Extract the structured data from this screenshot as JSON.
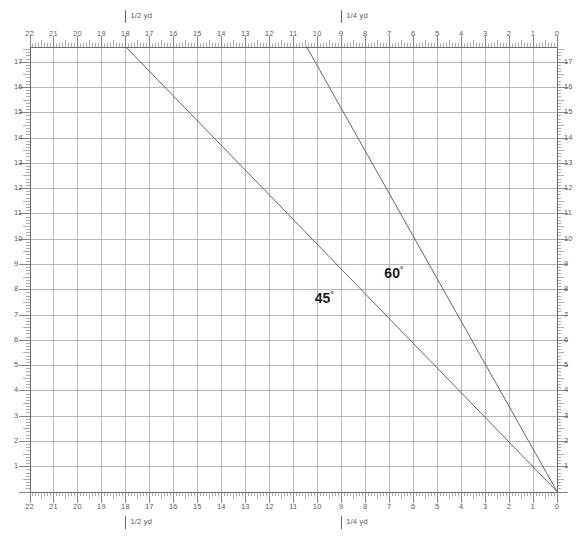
{
  "chart_data": {
    "type": "line",
    "title": "",
    "xlabel": "",
    "ylabel": "",
    "grid": true,
    "legend": "none",
    "xlim": [
      0,
      22
    ],
    "ylim": [
      0,
      17.6
    ],
    "x_axis": {
      "direction": "right-to-left",
      "major_tick_labels": [
        "22",
        "21",
        "20",
        "19",
        "18",
        "17",
        "16",
        "15",
        "14",
        "13",
        "12",
        "11",
        "10",
        "9",
        "8",
        "7",
        "6",
        "5",
        "4",
        "3",
        "2",
        "1",
        "0"
      ],
      "minor_ticks_per_major": 8,
      "unit_markers": [
        {
          "label": "1/2 yd",
          "value": 18
        },
        {
          "label": "1/4 yd",
          "value": 9
        }
      ]
    },
    "y_axis": {
      "direction": "bottom-to-top",
      "major_tick_labels": [
        "1",
        "2",
        "3",
        "4",
        "5",
        "6",
        "7",
        "8",
        "9",
        "10",
        "11",
        "12",
        "13",
        "14",
        "15",
        "16",
        "17"
      ],
      "minor_ticks_per_major": 8
    },
    "series": [
      {
        "name": "45",
        "label": "45°",
        "degree_symbol": "°",
        "color": "#55555a",
        "points": [
          [
            18,
            17.6
          ],
          [
            0,
            0
          ]
        ],
        "label_position": [
          10.1,
          7.6
        ]
      },
      {
        "name": "60",
        "label": "60°",
        "degree_symbol": "°",
        "color": "#55555a",
        "points": [
          [
            10.45,
            17.6
          ],
          [
            0,
            0
          ]
        ],
        "label_position": [
          7.2,
          8.6
        ]
      }
    ]
  },
  "rulers": {
    "top": {
      "name": "top-ruler",
      "labels": [
        "22",
        "21",
        "20",
        "19",
        "18",
        "17",
        "16",
        "15",
        "14",
        "13",
        "12",
        "11",
        "10",
        "9",
        "8",
        "7",
        "6",
        "5",
        "4",
        "3",
        "2",
        "1",
        "0"
      ],
      "markers": [
        "1/2 yd",
        "1/4 yd"
      ]
    },
    "bottom": {
      "name": "bottom-ruler",
      "labels": [
        "22",
        "21",
        "20",
        "19",
        "18",
        "17",
        "16",
        "15",
        "14",
        "13",
        "12",
        "11",
        "10",
        "9",
        "8",
        "7",
        "6",
        "5",
        "4",
        "3",
        "2",
        "1",
        "0"
      ],
      "markers": [
        "1/2 yd",
        "1/4 yd"
      ]
    },
    "left": {
      "name": "left-ruler",
      "labels": [
        "17",
        "16",
        "15",
        "14",
        "13",
        "12",
        "11",
        "10",
        "9",
        "8",
        "7",
        "6",
        "5",
        "4",
        "3",
        "2",
        "1"
      ]
    },
    "right": {
      "name": "right-ruler",
      "labels": [
        "17",
        "16",
        "15",
        "14",
        "13",
        "12",
        "11",
        "10",
        "9",
        "8",
        "7",
        "6",
        "5",
        "4",
        "3",
        "2",
        "1"
      ]
    }
  },
  "colors": {
    "background": "#ffffff",
    "grid_major": "#9a9aa0",
    "grid_minor": "#d5d5d8",
    "ruler_line": "#6a6a6a",
    "tick": "#7a7a7a",
    "line": "#55555a",
    "text": "#5a5a5a",
    "angle_text": "#1a1a1a"
  }
}
